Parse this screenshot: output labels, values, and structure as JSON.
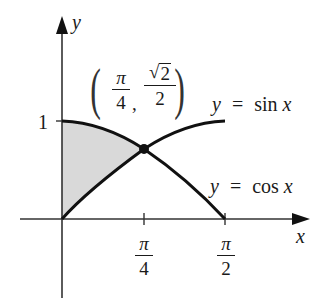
{
  "figure": {
    "axes": {
      "x_label": "x",
      "y_label": "y",
      "y_tick_label": "1",
      "x_ticks": [
        {
          "numerator": "π",
          "denominator": "4"
        },
        {
          "numerator": "π",
          "denominator": "2"
        }
      ]
    },
    "curves": [
      {
        "name": "sin",
        "label_lhs": "y",
        "label_eq": "=",
        "label_rhs": "sin",
        "label_var": "x"
      },
      {
        "name": "cos",
        "label_lhs": "y",
        "label_eq": "=",
        "label_rhs": "cos",
        "label_var": "x"
      }
    ],
    "intersection": {
      "x_num": "π",
      "x_den": "4",
      "comma": ",",
      "y_radical": "√",
      "y_radicand": "2",
      "y_den": "2",
      "open_paren": "(",
      "close_paren": ")"
    },
    "colors": {
      "ink": "#111111",
      "axis": "#333333",
      "shade": "#d9d9d9"
    }
  }
}
